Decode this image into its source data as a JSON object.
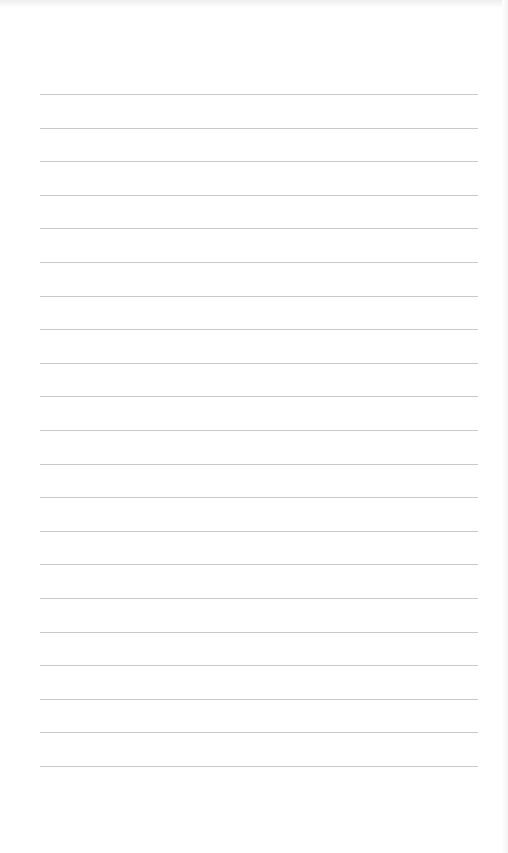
{
  "page": {
    "type": "lined-paper",
    "background_color": "#ffffff",
    "line_color": "#c9c9c9",
    "line_count": 21,
    "lines_y": [
      94,
      128,
      161,
      195,
      228,
      262,
      296,
      329,
      363,
      396,
      430,
      464,
      497,
      531,
      564,
      598,
      632,
      665,
      699,
      732,
      766
    ],
    "line_start_x": 40,
    "line_end_x": 478
  }
}
